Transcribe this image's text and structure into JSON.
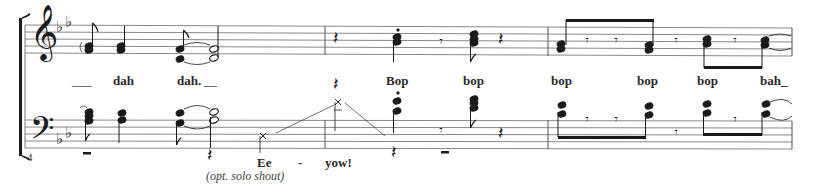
{
  "score": {
    "measure_number": "4",
    "key_signature": "B-flat major (2 flats)",
    "clefs": {
      "upper": "𝄞",
      "lower": "𝄢"
    },
    "flat_glyph": "♭",
    "colors": {
      "ink": "#1a1a1a",
      "staff_line": "#7a7a7a",
      "background": "#ffffff"
    },
    "upper_lyrics": [
      {
        "text": "___",
        "x": 72,
        "y": 76
      },
      {
        "text": "dah",
        "x": 113,
        "y": 74
      },
      {
        "text": "dah.",
        "x": 177,
        "y": 74
      },
      {
        "text": "__",
        "x": 204,
        "y": 76
      },
      {
        "text": "Bop",
        "x": 386,
        "y": 74
      },
      {
        "text": "bop",
        "x": 463,
        "y": 74
      },
      {
        "text": "bop",
        "x": 551,
        "y": 74
      },
      {
        "text": "bop",
        "x": 637,
        "y": 74
      },
      {
        "text": "bop",
        "x": 697,
        "y": 74
      },
      {
        "text": "bah_",
        "x": 760,
        "y": 74
      }
    ],
    "lower_lyrics": [
      {
        "text": "Ee",
        "x": 257,
        "y": 156
      },
      {
        "text": "-",
        "x": 298,
        "y": 156
      },
      {
        "text": "yow!",
        "x": 325,
        "y": 156
      }
    ],
    "annotation": {
      "text": "(opt. solo shout)",
      "x": 206,
      "y": 170
    },
    "rest_glyphs": {
      "quarter": "𝄽",
      "eighth": "𝄾"
    }
  }
}
